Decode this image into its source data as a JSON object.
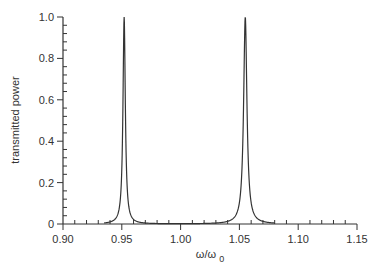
{
  "chart_data": {
    "type": "line",
    "title": "",
    "xlabel": "ω/ω0",
    "xlabel_main": "ω/ω",
    "xlabel_sub": "0",
    "ylabel": "transmitted power",
    "xlim": [
      0.9,
      1.15
    ],
    "ylim": [
      0,
      1.0
    ],
    "grid": false,
    "legend": null,
    "x_ticks": [
      "0.90",
      "0.95",
      "1.00",
      "1.05",
      "1.10",
      "1.15"
    ],
    "y_ticks": [
      "0",
      "0.2",
      "0.4",
      "0.6",
      "0.8",
      "1.0"
    ],
    "series": [
      {
        "name": "transmitted power",
        "peaks": [
          {
            "x0": 0.952,
            "height": 1.0,
            "hwhm": 0.0012
          },
          {
            "x0": 1.055,
            "height": 1.0,
            "hwhm": 0.0017
          }
        ],
        "x_range": [
          0.935,
          1.08
        ],
        "sample_points": [
          {
            "x": 0.935,
            "y": 0.0
          },
          {
            "x": 0.94,
            "y": 0.01
          },
          {
            "x": 0.945,
            "y": 0.03
          },
          {
            "x": 0.95,
            "y": 0.3
          },
          {
            "x": 0.952,
            "y": 1.0
          },
          {
            "x": 0.955,
            "y": 0.2
          },
          {
            "x": 0.96,
            "y": 0.05
          },
          {
            "x": 0.97,
            "y": 0.02
          },
          {
            "x": 1.0,
            "y": 0.005
          },
          {
            "x": 1.03,
            "y": 0.02
          },
          {
            "x": 1.045,
            "y": 0.06
          },
          {
            "x": 1.05,
            "y": 0.25
          },
          {
            "x": 1.055,
            "y": 1.0
          },
          {
            "x": 1.06,
            "y": 0.25
          },
          {
            "x": 1.065,
            "y": 0.06
          },
          {
            "x": 1.07,
            "y": 0.02
          },
          {
            "x": 1.08,
            "y": 0.0
          }
        ]
      }
    ],
    "colors": {
      "line": "#333333",
      "axis": "#333333",
      "background": "#ffffff"
    }
  }
}
